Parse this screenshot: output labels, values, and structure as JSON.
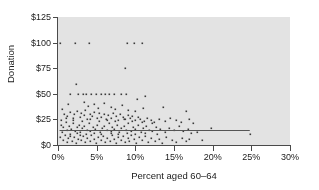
{
  "chart_data": {
    "type": "scatter",
    "title": "",
    "xlabel": "Percent aged 60–64",
    "ylabel": "Donation",
    "xlim": [
      0,
      30
    ],
    "ylim": [
      0,
      125
    ],
    "grid": false,
    "legend": "none",
    "panel_background": "#e3e3e3",
    "point_color": "#3a3a3a",
    "axis_color": "#4a4a4a",
    "xticks": [
      0,
      5,
      10,
      15,
      20,
      25,
      30
    ],
    "xtick_labels": [
      "0%",
      "5%",
      "10%",
      "15%",
      "20%",
      "25%",
      "30%"
    ],
    "yticks": [
      0,
      25,
      50,
      75,
      100,
      125
    ],
    "ytick_labels": [
      "$0",
      "$25",
      "$50",
      "$75",
      "$100",
      "$125"
    ],
    "reference_line": {
      "orientation": "horizontal",
      "y": 15,
      "x_start": 0.2,
      "x_end": 24.8,
      "color": "#555555"
    },
    "points": [
      [
        0.3,
        100
      ],
      [
        2.2,
        100
      ],
      [
        4.0,
        100
      ],
      [
        8.9,
        100
      ],
      [
        9.8,
        100
      ],
      [
        10.9,
        100
      ],
      [
        8.7,
        75
      ],
      [
        2.3,
        60
      ],
      [
        1.6,
        50
      ],
      [
        2.6,
        50
      ],
      [
        3.2,
        50
      ],
      [
        3.6,
        50
      ],
      [
        4.3,
        50
      ],
      [
        4.9,
        50
      ],
      [
        5.5,
        50
      ],
      [
        6.1,
        50
      ],
      [
        6.6,
        50
      ],
      [
        7.2,
        50
      ],
      [
        8.1,
        50
      ],
      [
        8.8,
        50
      ],
      [
        11.3,
        48
      ],
      [
        10.2,
        45
      ],
      [
        1.3,
        40
      ],
      [
        3.4,
        42
      ],
      [
        3.9,
        38
      ],
      [
        4.6,
        40
      ],
      [
        5.2,
        36
      ],
      [
        6.0,
        41
      ],
      [
        6.8,
        37
      ],
      [
        7.4,
        35
      ],
      [
        8.3,
        39
      ],
      [
        9.1,
        34
      ],
      [
        10.0,
        33
      ],
      [
        11.0,
        36
      ],
      [
        13.6,
        37
      ],
      [
        16.6,
        33
      ],
      [
        0.5,
        35
      ],
      [
        0.8,
        30
      ],
      [
        1.1,
        28
      ],
      [
        1.5,
        32
      ],
      [
        1.9,
        26
      ],
      [
        2.1,
        30
      ],
      [
        2.5,
        33
      ],
      [
        2.8,
        27
      ],
      [
        3.0,
        31
      ],
      [
        3.3,
        29
      ],
      [
        3.5,
        34
      ],
      [
        3.8,
        25
      ],
      [
        4.1,
        30
      ],
      [
        4.4,
        28
      ],
      [
        4.7,
        32
      ],
      [
        5.0,
        26
      ],
      [
        5.3,
        31
      ],
      [
        5.6,
        27
      ],
      [
        5.9,
        30
      ],
      [
        6.2,
        25
      ],
      [
        6.5,
        29
      ],
      [
        6.9,
        26
      ],
      [
        7.1,
        31
      ],
      [
        7.5,
        28
      ],
      [
        7.8,
        24
      ],
      [
        8.0,
        30
      ],
      [
        8.4,
        27
      ],
      [
        8.6,
        25
      ],
      [
        9.0,
        29
      ],
      [
        9.3,
        26
      ],
      [
        9.6,
        28
      ],
      [
        9.9,
        24
      ],
      [
        10.3,
        27
      ],
      [
        10.6,
        25
      ],
      [
        11.1,
        23
      ],
      [
        11.5,
        26
      ],
      [
        12.0,
        24
      ],
      [
        12.4,
        22
      ],
      [
        13.0,
        25
      ],
      [
        13.8,
        23
      ],
      [
        14.5,
        26
      ],
      [
        15.2,
        24
      ],
      [
        15.9,
        22
      ],
      [
        16.9,
        25
      ],
      [
        17.4,
        21
      ],
      [
        0.4,
        20
      ],
      [
        0.7,
        18
      ],
      [
        1.0,
        22
      ],
      [
        1.2,
        15
      ],
      [
        1.4,
        19
      ],
      [
        1.7,
        16
      ],
      [
        2.0,
        21
      ],
      [
        2.2,
        14
      ],
      [
        2.4,
        18
      ],
      [
        2.7,
        20
      ],
      [
        2.9,
        13
      ],
      [
        3.1,
        17
      ],
      [
        3.4,
        19
      ],
      [
        3.7,
        15
      ],
      [
        4.0,
        21
      ],
      [
        4.2,
        14
      ],
      [
        4.5,
        18
      ],
      [
        4.8,
        16
      ],
      [
        5.1,
        20
      ],
      [
        5.4,
        13
      ],
      [
        5.7,
        17
      ],
      [
        6.0,
        19
      ],
      [
        6.3,
        15
      ],
      [
        6.6,
        21
      ],
      [
        6.8,
        14
      ],
      [
        7.0,
        18
      ],
      [
        7.3,
        16
      ],
      [
        7.6,
        20
      ],
      [
        7.9,
        13
      ],
      [
        8.2,
        17
      ],
      [
        8.5,
        19
      ],
      [
        8.8,
        15
      ],
      [
        9.1,
        21
      ],
      [
        9.4,
        14
      ],
      [
        9.7,
        18
      ],
      [
        10.0,
        16
      ],
      [
        10.4,
        20
      ],
      [
        10.7,
        13
      ],
      [
        11.0,
        17
      ],
      [
        11.4,
        19
      ],
      [
        11.8,
        15
      ],
      [
        12.2,
        14
      ],
      [
        12.7,
        18
      ],
      [
        13.2,
        16
      ],
      [
        13.9,
        13
      ],
      [
        14.4,
        17
      ],
      [
        15.0,
        15
      ],
      [
        15.6,
        19
      ],
      [
        16.2,
        14
      ],
      [
        16.8,
        16
      ],
      [
        17.2,
        12
      ],
      [
        18.0,
        13
      ],
      [
        19.8,
        17
      ],
      [
        24.8,
        11
      ],
      [
        0.3,
        8
      ],
      [
        0.6,
        5
      ],
      [
        0.9,
        10
      ],
      [
        1.1,
        3
      ],
      [
        1.3,
        7
      ],
      [
        1.6,
        9
      ],
      [
        1.8,
        4
      ],
      [
        2.1,
        8
      ],
      [
        2.3,
        2
      ],
      [
        2.6,
        6
      ],
      [
        2.8,
        10
      ],
      [
        3.0,
        5
      ],
      [
        3.2,
        9
      ],
      [
        3.5,
        3
      ],
      [
        3.8,
        7
      ],
      [
        4.1,
        4
      ],
      [
        4.3,
        10
      ],
      [
        4.6,
        6
      ],
      [
        4.9,
        2
      ],
      [
        5.2,
        8
      ],
      [
        5.5,
        5
      ],
      [
        5.8,
        9
      ],
      [
        6.1,
        3
      ],
      [
        6.4,
        7
      ],
      [
        6.7,
        4
      ],
      [
        7.0,
        10
      ],
      [
        7.2,
        6
      ],
      [
        7.5,
        2
      ],
      [
        7.8,
        8
      ],
      [
        8.1,
        5
      ],
      [
        8.4,
        9
      ],
      [
        8.7,
        3
      ],
      [
        9.0,
        7
      ],
      [
        9.2,
        4
      ],
      [
        9.5,
        10
      ],
      [
        9.8,
        6
      ],
      [
        10.1,
        2
      ],
      [
        10.5,
        8
      ],
      [
        10.8,
        5
      ],
      [
        11.2,
        9
      ],
      [
        11.6,
        3
      ],
      [
        12.0,
        7
      ],
      [
        12.5,
        4
      ],
      [
        13.1,
        6
      ],
      [
        13.5,
        2
      ],
      [
        14.0,
        8
      ],
      [
        14.7,
        5
      ],
      [
        15.3,
        3
      ],
      [
        16.0,
        7
      ],
      [
        16.5,
        4
      ],
      [
        17.0,
        6
      ],
      [
        18.6,
        5
      ],
      [
        0.5,
        13
      ],
      [
        1.5,
        11
      ],
      [
        2.5,
        12
      ],
      [
        3.6,
        11
      ],
      [
        4.7,
        12
      ],
      [
        5.6,
        11
      ],
      [
        6.9,
        12
      ],
      [
        7.7,
        11
      ],
      [
        8.9,
        12
      ],
      [
        9.9,
        11
      ],
      [
        11.3,
        12
      ],
      [
        12.8,
        11
      ],
      [
        0.4,
        24
      ],
      [
        1.0,
        26
      ],
      [
        2.0,
        24
      ],
      [
        3.1,
        23
      ],
      [
        4.2,
        25
      ],
      [
        5.3,
        23
      ],
      [
        6.4,
        24
      ],
      [
        7.4,
        23
      ],
      [
        8.5,
        25
      ],
      [
        9.6,
        23
      ],
      [
        10.9,
        22
      ],
      [
        12.1,
        21
      ]
    ]
  }
}
